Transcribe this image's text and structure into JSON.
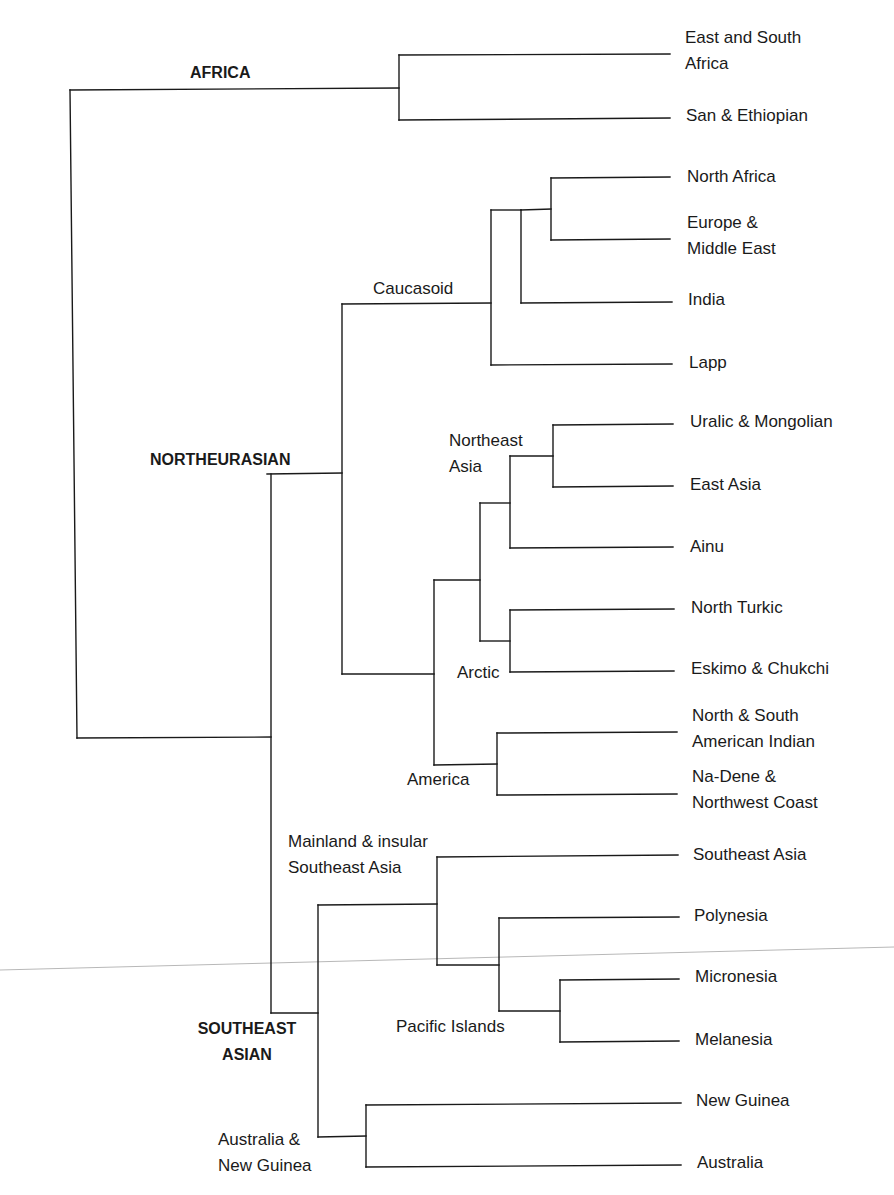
{
  "diagram": {
    "type": "dendrogram",
    "orientation": "left-to-right",
    "line_color": "#1a1a1a",
    "background": "#ffffff",
    "major_groups": [
      {
        "id": "africa",
        "label": "AFRICA",
        "x": 190,
        "y": 60
      },
      {
        "id": "northeurasian",
        "label": "NORTHEURASIAN",
        "x": 150,
        "y": 447
      },
      {
        "id": "southeast-asian",
        "label": "SOUTHEAST\nASIAN",
        "x": 172,
        "y": 1016,
        "center": true,
        "w": 150
      }
    ],
    "subgroups": [
      {
        "id": "caucasoid",
        "label": "Caucasoid",
        "x": 373,
        "y": 276
      },
      {
        "id": "northeast-asia",
        "label": "Northeast\nAsia",
        "x": 449,
        "y": 428
      },
      {
        "id": "arctic",
        "label": "Arctic",
        "x": 457,
        "y": 660
      },
      {
        "id": "america",
        "label": "America",
        "x": 407,
        "y": 767
      },
      {
        "id": "mainland-sea",
        "label": "Mainland & insular\nSoutheast Asia",
        "x": 288,
        "y": 829
      },
      {
        "id": "pacific-islands",
        "label": "Pacific Islands",
        "x": 396,
        "y": 1014
      },
      {
        "id": "australia-ng",
        "label": "Australia &\nNew Guinea",
        "x": 218,
        "y": 1127
      }
    ],
    "leaves": [
      {
        "id": "east-south-africa",
        "label": "East and South\nAfrica",
        "x": 685,
        "y": 25
      },
      {
        "id": "san-ethiopian",
        "label": "San & Ethiopian",
        "x": 686,
        "y": 103
      },
      {
        "id": "north-africa",
        "label": "North Africa",
        "x": 687,
        "y": 164
      },
      {
        "id": "europe-middle-east",
        "label": "Europe &\nMiddle East",
        "x": 687,
        "y": 210
      },
      {
        "id": "india",
        "label": "India",
        "x": 688,
        "y": 287
      },
      {
        "id": "lapp",
        "label": "Lapp",
        "x": 689,
        "y": 350
      },
      {
        "id": "uralic-mongolian",
        "label": "Uralic & Mongolian",
        "x": 690,
        "y": 409
      },
      {
        "id": "east-asia",
        "label": "East Asia",
        "x": 690,
        "y": 472
      },
      {
        "id": "ainu",
        "label": "Ainu",
        "x": 690,
        "y": 534
      },
      {
        "id": "north-turkic",
        "label": "North Turkic",
        "x": 691,
        "y": 595
      },
      {
        "id": "eskimo-chukchi",
        "label": "Eskimo & Chukchi",
        "x": 691,
        "y": 656
      },
      {
        "id": "american-indian",
        "label": "North & South\nAmerican Indian",
        "x": 692,
        "y": 703
      },
      {
        "id": "na-dene",
        "label": "Na-Dene &\nNorthwest Coast",
        "x": 692,
        "y": 764
      },
      {
        "id": "southeast-asia",
        "label": "Southeast Asia",
        "x": 693,
        "y": 842
      },
      {
        "id": "polynesia",
        "label": "Polynesia",
        "x": 694,
        "y": 903
      },
      {
        "id": "micronesia",
        "label": "Micronesia",
        "x": 695,
        "y": 964
      },
      {
        "id": "melanesia",
        "label": "Melanesia",
        "x": 695,
        "y": 1027
      },
      {
        "id": "new-guinea",
        "label": "New Guinea",
        "x": 696,
        "y": 1088
      },
      {
        "id": "australia",
        "label": "Australia",
        "x": 697,
        "y": 1150
      }
    ],
    "segments": [
      [
        70,
        90,
        399,
        88
      ],
      [
        70,
        90,
        77,
        738
      ],
      [
        77,
        738,
        271,
        737
      ],
      [
        399,
        55,
        399,
        120
      ],
      [
        399,
        55,
        670,
        54
      ],
      [
        399,
        120,
        670,
        118
      ],
      [
        271,
        474,
        271,
        1013
      ],
      [
        267,
        474,
        342,
        473
      ],
      [
        342,
        304,
        342,
        674
      ],
      [
        342,
        304,
        491,
        303
      ],
      [
        342,
        674,
        434,
        674
      ],
      [
        491,
        210,
        491,
        365
      ],
      [
        491,
        365,
        672,
        364
      ],
      [
        491,
        210,
        521,
        210
      ],
      [
        521,
        210,
        521,
        303
      ],
      [
        521,
        303,
        672,
        302
      ],
      [
        521,
        210,
        551,
        209
      ],
      [
        551,
        178,
        551,
        240
      ],
      [
        551,
        178,
        670,
        177
      ],
      [
        551,
        240,
        670,
        239
      ],
      [
        434,
        580,
        434,
        765
      ],
      [
        434,
        580,
        480,
        580
      ],
      [
        434,
        765,
        497,
        764
      ],
      [
        480,
        503,
        480,
        641
      ],
      [
        480,
        503,
        510,
        503
      ],
      [
        480,
        641,
        510,
        641
      ],
      [
        510,
        456,
        510,
        548
      ],
      [
        510,
        456,
        553,
        456
      ],
      [
        510,
        548,
        673,
        547
      ],
      [
        553,
        425,
        553,
        487
      ],
      [
        553,
        425,
        673,
        424
      ],
      [
        553,
        487,
        673,
        486
      ],
      [
        510,
        610,
        510,
        672
      ],
      [
        510,
        610,
        674,
        609
      ],
      [
        510,
        672,
        674,
        671
      ],
      [
        497,
        733,
        497,
        795
      ],
      [
        497,
        733,
        677,
        732
      ],
      [
        497,
        795,
        677,
        794
      ],
      [
        271,
        1013,
        318,
        1013
      ],
      [
        318,
        905,
        318,
        1137
      ],
      [
        318,
        905,
        437,
        904
      ],
      [
        318,
        1137,
        366,
        1136
      ],
      [
        437,
        857,
        437,
        965
      ],
      [
        437,
        857,
        678,
        855
      ],
      [
        437,
        965,
        499,
        965
      ],
      [
        499,
        918,
        499,
        1011
      ],
      [
        499,
        918,
        679,
        917
      ],
      [
        499,
        1011,
        560,
        1011
      ],
      [
        560,
        980,
        560,
        1042
      ],
      [
        560,
        980,
        679,
        979
      ],
      [
        560,
        1042,
        679,
        1041
      ],
      [
        366,
        1105,
        366,
        1167
      ],
      [
        366,
        1105,
        681,
        1103
      ],
      [
        366,
        1167,
        681,
        1165
      ]
    ],
    "artifact_line": [
      0,
      970,
      894,
      947
    ]
  }
}
